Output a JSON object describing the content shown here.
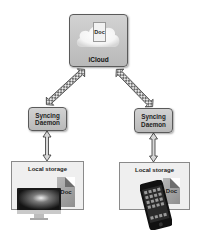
{
  "diagram": {
    "cloud_node": {
      "label": "iCloud",
      "doc_label": "Doc"
    },
    "daemons": [
      {
        "line1": "Syncing",
        "line2": "Daemon"
      },
      {
        "line1": "Syncing",
        "line2": "Daemon"
      }
    ],
    "devices": [
      {
        "storage_label": "Local storage",
        "doc_label": "Doc",
        "device": "desktop-computer-icon"
      },
      {
        "storage_label": "Local storage",
        "doc_label": "Doc",
        "device": "smartphone-icon"
      }
    ],
    "edges": [
      {
        "from": "iCloud",
        "to": "Syncing Daemon (left)",
        "type": "bidirectional"
      },
      {
        "from": "iCloud",
        "to": "Syncing Daemon (right)",
        "type": "bidirectional"
      },
      {
        "from": "Syncing Daemon (left)",
        "to": "Local storage (left)",
        "type": "bidirectional"
      },
      {
        "from": "Syncing Daemon (right)",
        "to": "Local storage (right)",
        "type": "bidirectional"
      }
    ],
    "colors": {
      "box_fill": "#c4c4c4",
      "box_border": "#5a5a5a",
      "storage_fill": "#efefef",
      "background": "#ffffff"
    }
  }
}
